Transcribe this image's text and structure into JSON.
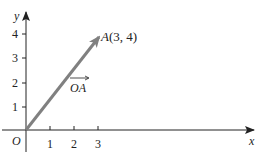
{
  "diagram": {
    "type": "coordinate-vector",
    "axes": {
      "x_label": "x",
      "y_label": "y",
      "origin_label": "O",
      "x_ticks": [
        "1",
        "2",
        "3"
      ],
      "y_ticks": [
        "1",
        "2",
        "3",
        "4"
      ]
    },
    "vector": {
      "name": "OA",
      "label": "OA",
      "from": [
        0,
        0
      ],
      "to": [
        3,
        4
      ],
      "point_label": "A(3, 4)",
      "color": "#808080"
    }
  }
}
